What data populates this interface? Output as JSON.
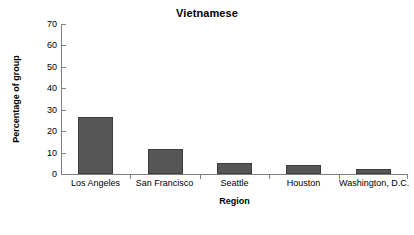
{
  "chart_data": {
    "type": "bar",
    "title": "Vietnamese",
    "xlabel": "Region",
    "ylabel": "Percentage of group",
    "categories": [
      "Los Angeles",
      "San Francisco",
      "Seattle",
      "Houston",
      "Washington, D.C."
    ],
    "values": [
      26.6,
      11.7,
      5.1,
      4.2,
      2.3
    ],
    "ylim": [
      0,
      70
    ],
    "yticks": [
      0,
      10,
      20,
      30,
      40,
      50,
      60,
      70
    ],
    "ytick_labels": [
      "0",
      "10",
      "20",
      "30",
      "40",
      "50",
      "60",
      "70"
    ],
    "grid": false,
    "legend": false,
    "bar_color": "#565656",
    "axis_color": "#808080",
    "text_color": "#000000",
    "background": "#ffffff"
  }
}
